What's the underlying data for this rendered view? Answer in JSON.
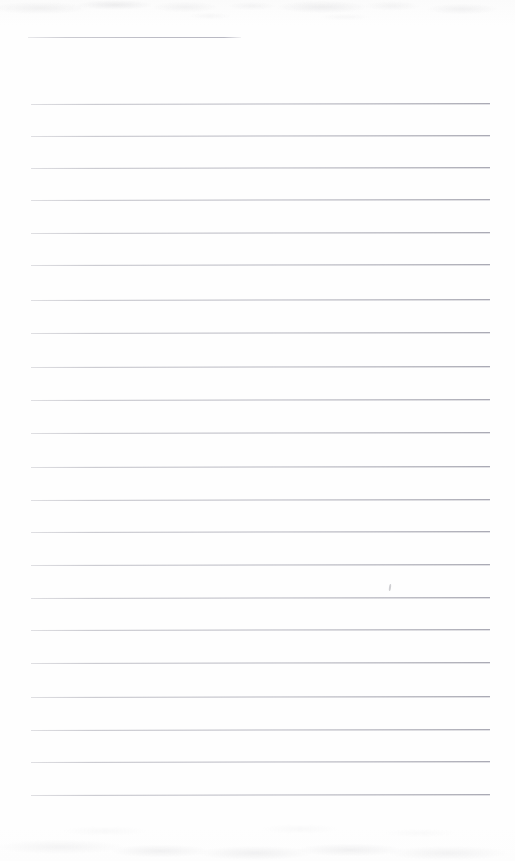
{
  "document": {
    "kind": "scanned-lined-paper",
    "title": "Blank ruled notebook page",
    "text_content": "",
    "page_width": 515,
    "page_height": 861,
    "background_color": "#fdfdfd",
    "rule_color": "#b6b6c0",
    "rule_color_right": "#8e8e9c"
  },
  "ruling": {
    "left_margin": 30,
    "right_edge": 490,
    "line_spacing": 32.7,
    "line_thickness": 1,
    "vertical_margin_rule": false,
    "short_first_rule": {
      "name": "partial-top-rule",
      "x": 28,
      "y": 37,
      "width": 213
    },
    "lines": [
      {
        "y": 104,
        "x": 31,
        "width": 459,
        "slope": -0.9
      },
      {
        "y": 136,
        "x": 31,
        "width": 459,
        "slope": -0.9
      },
      {
        "y": 168,
        "x": 31,
        "width": 459,
        "slope": -0.9
      },
      {
        "y": 200,
        "x": 31,
        "width": 459,
        "slope": -0.9
      },
      {
        "y": 233,
        "x": 31,
        "width": 459,
        "slope": -0.9
      },
      {
        "y": 265,
        "x": 31,
        "width": 459,
        "slope": -0.9
      },
      {
        "y": 300,
        "x": 31,
        "width": 459,
        "slope": -0.9
      },
      {
        "y": 333,
        "x": 31,
        "width": 459,
        "slope": -0.9
      },
      {
        "y": 367,
        "x": 31,
        "width": 459,
        "slope": -0.9
      },
      {
        "y": 400,
        "x": 31,
        "width": 459,
        "slope": -0.9
      },
      {
        "y": 433,
        "x": 31,
        "width": 459,
        "slope": -0.9
      },
      {
        "y": 467,
        "x": 31,
        "width": 459,
        "slope": -0.9
      },
      {
        "y": 500,
        "x": 31,
        "width": 459,
        "slope": -0.9
      },
      {
        "y": 532,
        "x": 31,
        "width": 459,
        "slope": -0.9
      },
      {
        "y": 565,
        "x": 31,
        "width": 459,
        "slope": -0.9
      },
      {
        "y": 598,
        "x": 31,
        "width": 459,
        "slope": -0.9
      },
      {
        "y": 630,
        "x": 31,
        "width": 459,
        "slope": -0.9
      },
      {
        "y": 663,
        "x": 31,
        "width": 459,
        "slope": -0.9
      },
      {
        "y": 697,
        "x": 31,
        "width": 459,
        "slope": -0.9
      },
      {
        "y": 730,
        "x": 31,
        "width": 459,
        "slope": -0.9
      },
      {
        "y": 762,
        "x": 31,
        "width": 459,
        "slope": -0.9
      },
      {
        "y": 795,
        "x": 31,
        "width": 459,
        "slope": -0.9
      }
    ]
  },
  "artifacts": {
    "stray_marks": [
      {
        "name": "stray-pencil-tick",
        "x": 389,
        "y": 584
      }
    ],
    "noise_bands": [
      {
        "name": "scan-noise-top",
        "y": 0,
        "height": 26
      },
      {
        "name": "scan-noise-bottom",
        "y": 801,
        "height": 60
      }
    ]
  }
}
